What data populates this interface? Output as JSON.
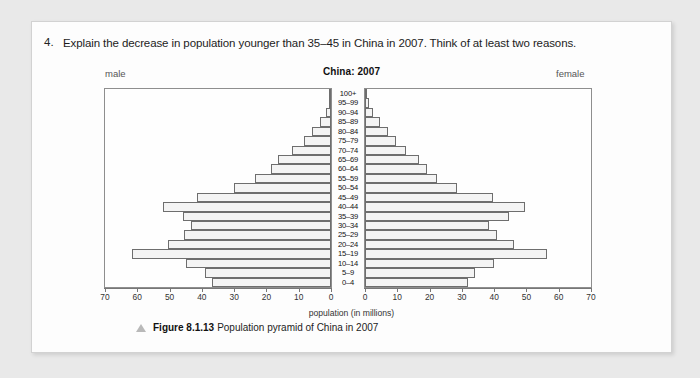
{
  "question": {
    "number": "4.",
    "text": "Explain the decrease in population younger than 35–45 in China in 2007. Think of at least two reasons."
  },
  "figure": {
    "male_label": "male",
    "female_label": "female",
    "caption_bold": "Figure 8.1.13",
    "caption_text": "Population pyramid of China in 2007",
    "marker_icon": "triangle-icon"
  },
  "chart_data": {
    "type": "bar",
    "subtype": "population-pyramid",
    "title": "China: 2007",
    "xlabel": "population (in millions)",
    "ylabel": "",
    "categories": [
      "100+",
      "95–99",
      "90–94",
      "85–89",
      "80–84",
      "75–79",
      "70–74",
      "65–69",
      "60–64",
      "55–59",
      "50–54",
      "45–49",
      "40–44",
      "35–39",
      "30–34",
      "25–29",
      "20–24",
      "15–19",
      "10–14",
      "5–9",
      "0–4"
    ],
    "series": [
      {
        "name": "male",
        "side": "left",
        "values": [
          0.1,
          0.7,
          1.6,
          3.4,
          6.0,
          8.5,
          12.0,
          16.5,
          18.5,
          23.5,
          30.0,
          41.5,
          52.0,
          46.0,
          43.5,
          45.5,
          50.5,
          61.5,
          45.0,
          39.0,
          37.0
        ]
      },
      {
        "name": "female",
        "side": "right",
        "values": [
          0.2,
          1.1,
          2.4,
          4.5,
          7.2,
          9.7,
          12.8,
          16.6,
          19.3,
          22.4,
          28.5,
          39.5,
          49.5,
          44.5,
          38.5,
          41.0,
          46.0,
          56.5,
          40.0,
          34.0,
          32.0
        ]
      }
    ],
    "xlim": [
      0,
      70
    ],
    "xticks": [
      0,
      10,
      20,
      30,
      40,
      50,
      60,
      70
    ],
    "xtick_labels_left": [
      "70",
      "60",
      "50",
      "40",
      "30",
      "20",
      "10",
      "0"
    ],
    "xtick_labels_right": [
      "0",
      "10",
      "20",
      "30",
      "40",
      "50",
      "60",
      "70"
    ],
    "grid": false,
    "legend": "none",
    "colors": {
      "bar_fill": "#f4f4f4",
      "bar_stroke": "#6e6e6e",
      "axis": "#777777"
    }
  }
}
